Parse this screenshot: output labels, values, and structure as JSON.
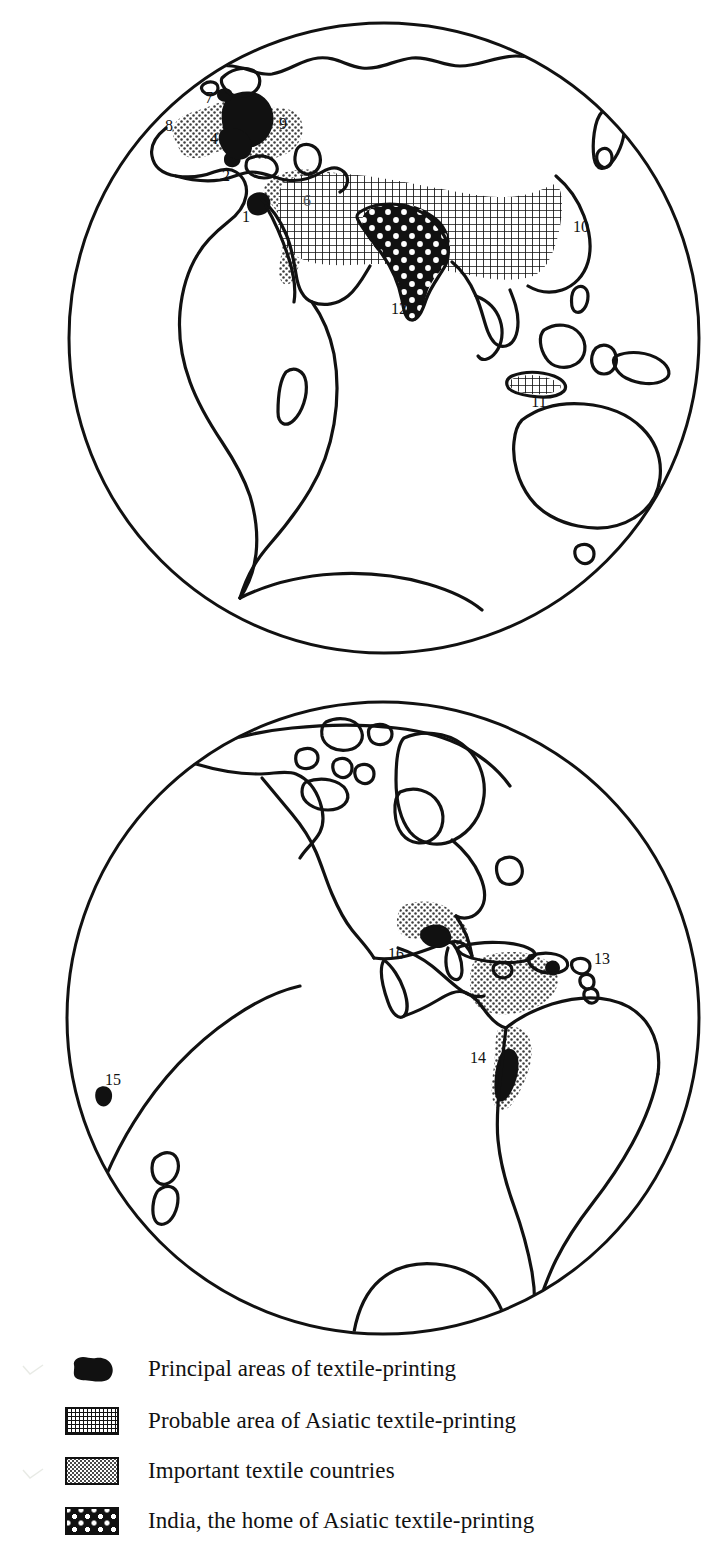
{
  "figure": {
    "type": "map",
    "globes": [
      {
        "name": "eastern-hemisphere",
        "center_x": 384,
        "center_y": 338,
        "radius": 316,
        "markers": [
          {
            "id": "1",
            "label_x": 246,
            "label_y": 217,
            "dot_x": 258,
            "dot_y": 204,
            "kind": "principal"
          },
          {
            "id": "2",
            "label_x": 226,
            "label_y": 176,
            "dot_x": 233,
            "dot_y": 163,
            "kind": "principal"
          },
          {
            "id": "3",
            "label_x": 231,
            "label_y": 139,
            "dot_x": 240,
            "dot_y": 152,
            "kind": "principal"
          },
          {
            "id": "4",
            "label_x": 214,
            "label_y": 139,
            "dot_x": 222,
            "dot_y": 152,
            "kind": "principal"
          },
          {
            "id": "5",
            "label_x": 254,
            "label_y": 113,
            "dot_x": 246,
            "dot_y": 104,
            "kind": "principal"
          },
          {
            "id": "6",
            "label_x": 307,
            "label_y": 201,
            "dot_x": 0,
            "dot_y": 0,
            "kind": "region"
          },
          {
            "id": "7",
            "label_x": 209,
            "label_y": 98,
            "dot_x": 224,
            "dot_y": 94,
            "kind": "principal"
          },
          {
            "id": "8",
            "label_x": 169,
            "label_y": 126,
            "dot_x": 0,
            "dot_y": 0,
            "kind": "region"
          },
          {
            "id": "9",
            "label_x": 283,
            "label_y": 124,
            "dot_x": 0,
            "dot_y": 0,
            "kind": "region"
          },
          {
            "id": "10",
            "label_x": 581,
            "label_y": 227,
            "dot_x": 0,
            "dot_y": 0,
            "kind": "region"
          },
          {
            "id": "11",
            "label_x": 539,
            "label_y": 402,
            "dot_x": 0,
            "dot_y": 0,
            "kind": "region"
          },
          {
            "id": "12",
            "label_x": 399,
            "label_y": 309,
            "dot_x": 0,
            "dot_y": 0,
            "kind": "region"
          }
        ]
      },
      {
        "name": "western-hemisphere",
        "center_x": 383,
        "center_y": 1018,
        "radius": 317,
        "markers": [
          {
            "id": "13",
            "label_x": 602,
            "label_y": 959,
            "dot_x": 0,
            "dot_y": 0,
            "kind": "region"
          },
          {
            "id": "14",
            "label_x": 478,
            "label_y": 1058,
            "dot_x": 0,
            "dot_y": 0,
            "kind": "region"
          },
          {
            "id": "15",
            "label_x": 113,
            "label_y": 1080,
            "dot_x": 104,
            "dot_y": 1093,
            "kind": "principal"
          },
          {
            "id": "16",
            "label_x": 396,
            "label_y": 954,
            "dot_x": 0,
            "dot_y": 0,
            "kind": "region"
          }
        ]
      }
    ]
  },
  "legend": {
    "items": [
      {
        "swatch": "solid-black-blob",
        "label": "Principal areas of textile-printing"
      },
      {
        "swatch": "fine-grid-hatch",
        "label": "Probable area of Asiatic textile-printing"
      },
      {
        "swatch": "light-stipple",
        "label": "Important textile countries"
      },
      {
        "swatch": "black-with-white-dots",
        "label": "India, the home of Asiatic textile-printing"
      }
    ]
  },
  "colors": {
    "ink": "#111111",
    "paper": "#ffffff",
    "stipple": "#4a4a4a"
  }
}
